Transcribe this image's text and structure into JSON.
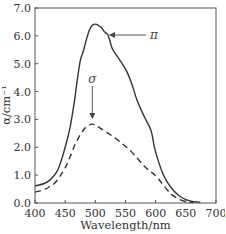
{
  "chart_data": {
    "type": "line",
    "title": "",
    "xlabel": "Wavelength/nm",
    "ylabel": "α/cm⁻¹",
    "xlim": [
      400,
      700
    ],
    "ylim": [
      0,
      7
    ],
    "xticks": [
      400,
      450,
      500,
      550,
      600,
      650,
      700
    ],
    "yticks": [
      0,
      1,
      2,
      3,
      4,
      5,
      6,
      7
    ],
    "xtick_labels": [
      "400",
      "450",
      "500",
      "550",
      "600",
      "650",
      "700"
    ],
    "ytick_labels": [
      "0.0",
      "1.0",
      "2.0",
      "3.0",
      "4.0",
      "5.0",
      "6.0",
      "7.0"
    ],
    "grid": false,
    "legend": "none",
    "series": [
      {
        "name": "π",
        "style": "solid",
        "color": "#333333",
        "x": [
          400,
          415,
          425,
          435,
          441,
          450,
          458,
          465,
          470,
          475,
          480,
          485,
          490,
          495,
          500,
          505,
          510,
          515,
          521,
          525,
          529,
          540,
          551,
          560,
          569,
          580,
          592,
          598,
          604,
          612,
          620,
          630,
          640,
          650,
          660,
          668,
          674
        ],
        "y": [
          0.61,
          0.7,
          0.83,
          1.08,
          1.36,
          2.0,
          2.7,
          3.6,
          4.4,
          5.1,
          5.45,
          5.85,
          6.2,
          6.38,
          6.42,
          6.38,
          6.3,
          6.15,
          6.03,
          5.75,
          5.5,
          5.15,
          4.77,
          4.3,
          3.7,
          3.15,
          2.62,
          2.0,
          1.54,
          1.05,
          0.72,
          0.44,
          0.24,
          0.12,
          0.06,
          0.04,
          0.03
        ]
      },
      {
        "name": "σ",
        "style": "dashed",
        "color": "#333333",
        "x": [
          400,
          415,
          425,
          433,
          441,
          450,
          458,
          466,
          475,
          483,
          490,
          495,
          500,
          508,
          520,
          533,
          545,
          557,
          569,
          580,
          590,
          599,
          610,
          620,
          627,
          640,
          650,
          662
        ],
        "y": [
          0.39,
          0.48,
          0.6,
          0.72,
          0.95,
          1.26,
          1.65,
          2.08,
          2.45,
          2.69,
          2.8,
          2.83,
          2.8,
          2.69,
          2.52,
          2.33,
          2.12,
          1.9,
          1.62,
          1.35,
          1.15,
          1.0,
          0.72,
          0.45,
          0.29,
          0.12,
          0.05,
          0.02
        ]
      }
    ],
    "annotations": [
      {
        "text": "π",
        "target_series": "π",
        "arrow_to": [
          521,
          6.03
        ],
        "direction": "from-right"
      },
      {
        "text": "σ",
        "target_series": "σ",
        "arrow_to": [
          495,
          3.05
        ],
        "direction": "from-above"
      }
    ]
  }
}
